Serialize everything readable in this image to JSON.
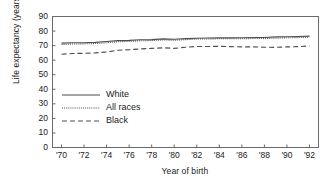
{
  "chart_data": {
    "type": "line",
    "title": "",
    "xlabel": "Year of birth",
    "ylabel": "Life expectancy (years)",
    "xlim": [
      1969.2,
      1992.8
    ],
    "ylim": [
      0,
      90
    ],
    "ytick_values": [
      0,
      10,
      20,
      30,
      40,
      50,
      60,
      70,
      80,
      90
    ],
    "ytick_labels": [
      "0",
      "10",
      "20",
      "30",
      "40",
      "50",
      "60",
      "70",
      "80",
      "90"
    ],
    "xtick_values": [
      1970,
      1972,
      1974,
      1976,
      1978,
      1980,
      1982,
      1984,
      1986,
      1988,
      1990,
      1992
    ],
    "xtick_labels": [
      "'70",
      "'72",
      "'74",
      "'76",
      "'78",
      "'80",
      "'82",
      "'84",
      "'86",
      "'88",
      "'90",
      "'92"
    ],
    "grid": false,
    "legend_position": "center-left",
    "x": [
      1970,
      1971,
      1972,
      1973,
      1974,
      1975,
      1976,
      1977,
      1978,
      1979,
      1980,
      1981,
      1982,
      1983,
      1984,
      1985,
      1986,
      1987,
      1988,
      1989,
      1990,
      1991,
      1992
    ],
    "series": [
      {
        "name": "White",
        "style": "solid",
        "color": "#4d4d4d",
        "values": [
          71.7,
          72.0,
          72.0,
          72.2,
          72.8,
          73.4,
          73.6,
          74.0,
          74.1,
          74.6,
          74.4,
          74.8,
          75.1,
          75.2,
          75.3,
          75.3,
          75.4,
          75.6,
          75.6,
          76.0,
          76.1,
          76.3,
          76.5
        ]
      },
      {
        "name": "All races",
        "style": "dotted",
        "color": "#4d4d4d",
        "values": [
          70.8,
          71.1,
          71.2,
          71.4,
          72.0,
          72.6,
          72.9,
          73.3,
          73.5,
          73.9,
          73.7,
          74.1,
          74.5,
          74.6,
          74.7,
          74.7,
          74.7,
          74.9,
          74.9,
          75.1,
          75.4,
          75.5,
          75.8
        ]
      },
      {
        "name": "Black",
        "style": "dashed",
        "color": "#4d4d4d",
        "values": [
          64.1,
          64.6,
          64.7,
          65.0,
          65.6,
          66.8,
          67.2,
          67.7,
          68.1,
          68.5,
          68.1,
          68.9,
          69.4,
          69.4,
          69.5,
          69.3,
          69.1,
          69.1,
          68.9,
          68.8,
          69.1,
          69.3,
          69.8
        ]
      }
    ],
    "legend_entries": [
      {
        "label": "White",
        "style": "solid"
      },
      {
        "label": "All races",
        "style": "dotted"
      },
      {
        "label": "Black",
        "style": "dashed"
      }
    ]
  },
  "axis_style": {
    "frame_color": "#6b6b6b",
    "text_color": "#1a1a1a",
    "background": "#ffffff"
  }
}
